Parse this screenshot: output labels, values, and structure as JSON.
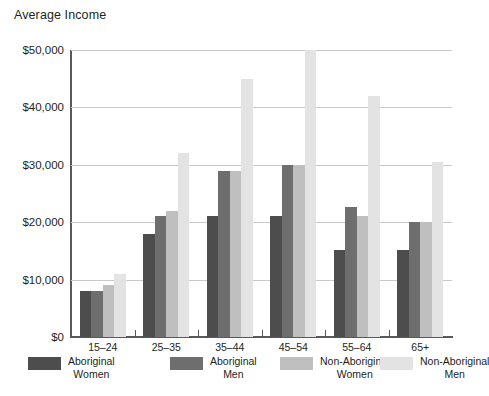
{
  "chart_data": {
    "type": "bar",
    "title": "Average Income",
    "xlabel": "",
    "ylabel": "",
    "ylim": [
      0,
      50000
    ],
    "grid": true,
    "legend_position": "bottom",
    "categories": [
      "15–24",
      "25–35",
      "35–44",
      "45–54",
      "55–64",
      "65+"
    ],
    "ytick_labels": [
      "$50,000",
      "$40,000",
      "$30,000",
      "$20,000",
      "$10,000",
      "$0"
    ],
    "ytick_values": [
      50000,
      40000,
      30000,
      20000,
      10000,
      0
    ],
    "series": [
      {
        "name": "Aboriginal Women",
        "name_line1": "Aboriginal",
        "name_line2": "Women",
        "color": "#4d4d4d",
        "values": [
          8000,
          18000,
          21000,
          21000,
          15200,
          15200
        ]
      },
      {
        "name": "Aboriginal Men",
        "name_line1": "Aboriginal",
        "name_line2": "Men",
        "color": "#6e6e6e",
        "values": [
          8100,
          21000,
          29000,
          30000,
          22700,
          20000
        ]
      },
      {
        "name": "Non-Aboriginal Women",
        "name_line1": "Non-Aboriginal",
        "name_line2": "Women",
        "color": "#bfbfbf",
        "values": [
          9000,
          22000,
          29000,
          30000,
          21000,
          20000
        ]
      },
      {
        "name": "Non-Aboriginal Men",
        "name_line1": "Non-Aboriginal",
        "name_line2": "Men",
        "color": "#e3e3e3",
        "values": [
          11000,
          32000,
          45000,
          50000,
          42000,
          30500
        ]
      }
    ]
  },
  "axis": {
    "axis_color": "#58595b",
    "gridline_color": "#c9c9c9"
  }
}
